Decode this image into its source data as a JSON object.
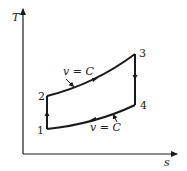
{
  "diagram": {
    "type": "T-s diagram",
    "axes": {
      "y_label": "T",
      "x_label": "s"
    },
    "points": [
      {
        "id": "1",
        "label": "1"
      },
      {
        "id": "2",
        "label": "2"
      },
      {
        "id": "3",
        "label": "3"
      },
      {
        "id": "4",
        "label": "4"
      }
    ],
    "annotations": {
      "top_curve": "v = C",
      "bottom_curve": "v = C"
    },
    "colors": {
      "line": "#1a1a1a",
      "background": "#ffffff"
    }
  }
}
